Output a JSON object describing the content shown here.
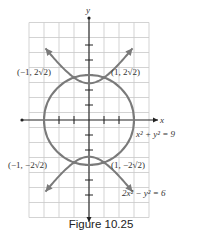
{
  "chart_data": {
    "type": "line",
    "title": "",
    "xlabel": "x",
    "ylabel": "y",
    "xlim": [
      -4,
      4
    ],
    "ylim": [
      -6.5,
      6.5
    ],
    "grid": true,
    "series": [
      {
        "name": "circle",
        "equation_label": "x² + y² = 9",
        "kind": "circle",
        "radius": 3,
        "center": [
          0,
          0
        ],
        "color": "#7a7a7a"
      },
      {
        "name": "hyperbola",
        "equation_label": "2x² − y² = 6",
        "kind": "hyperbola",
        "branch_equation": "y² − 2x² = 6",
        "x_range": [
          -2.9,
          2.9
        ],
        "arrows": true,
        "color": "#7a7a7a"
      }
    ],
    "intersection_points": [
      {
        "x": -1,
        "y": 2.828,
        "label": "(−1, 2√2)"
      },
      {
        "x": 1,
        "y": 2.828,
        "label": "(1, 2√2)"
      },
      {
        "x": -1,
        "y": -2.828,
        "label": "(−1, −2√2)"
      },
      {
        "x": 1,
        "y": -2.828,
        "label": "(1, −2√2)"
      }
    ],
    "x_ticks": [
      -3,
      -2,
      -1,
      1,
      2,
      3
    ],
    "y_ticks": [
      -5,
      -4,
      -3,
      -2,
      -1,
      1,
      2,
      3,
      4,
      5
    ]
  },
  "labels": {
    "x_axis": "x",
    "y_axis": "y",
    "circle_eq": "x² + y² = 9",
    "hyperbola_eq": "2x² − y² = 6",
    "pt_ul": "(−1, 2√2)",
    "pt_ur": "(1, 2√2)",
    "pt_ll": "(−1, −2√2)",
    "pt_lr": "(1, −2√2)"
  },
  "caption": "Figure 10.25"
}
